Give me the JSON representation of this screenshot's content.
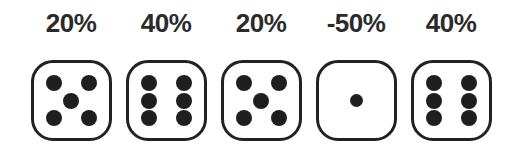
{
  "canvas": {
    "width": 522,
    "height": 154,
    "background_color": "#ffffff"
  },
  "style": {
    "die_outline_color": "#222222",
    "pip_color": "#1f1f1f",
    "label_color": "#2b2b2b"
  },
  "dice": [
    {
      "label": "20%",
      "face_value": 5,
      "pips": [
        {
          "col": "l",
          "row": "t",
          "size": "normal"
        },
        {
          "col": "r",
          "row": "t",
          "size": "normal"
        },
        {
          "col": "c",
          "row": "m",
          "size": "normal"
        },
        {
          "col": "l",
          "row": "b",
          "size": "normal"
        },
        {
          "col": "r",
          "row": "b",
          "size": "normal"
        }
      ]
    },
    {
      "label": "40%",
      "face_value": 6,
      "pips": [
        {
          "col": "l",
          "row": "t",
          "size": "normal"
        },
        {
          "col": "r",
          "row": "t",
          "size": "normal"
        },
        {
          "col": "l",
          "row": "m",
          "size": "normal"
        },
        {
          "col": "r",
          "row": "m",
          "size": "normal"
        },
        {
          "col": "l",
          "row": "b",
          "size": "normal"
        },
        {
          "col": "r",
          "row": "b",
          "size": "normal"
        }
      ]
    },
    {
      "label": "20%",
      "face_value": 5,
      "pips": [
        {
          "col": "l",
          "row": "t",
          "size": "normal"
        },
        {
          "col": "r",
          "row": "t",
          "size": "normal"
        },
        {
          "col": "c",
          "row": "m",
          "size": "normal"
        },
        {
          "col": "l",
          "row": "b",
          "size": "normal"
        },
        {
          "col": "r",
          "row": "b",
          "size": "normal"
        }
      ]
    },
    {
      "label": "-50%",
      "face_value": 1,
      "pips": [
        {
          "col": "c",
          "row": "m",
          "size": "small"
        }
      ]
    },
    {
      "label": "40%",
      "face_value": 6,
      "pips": [
        {
          "col": "l",
          "row": "t",
          "size": "normal"
        },
        {
          "col": "r",
          "row": "t",
          "size": "normal"
        },
        {
          "col": "l",
          "row": "m",
          "size": "normal"
        },
        {
          "col": "r",
          "row": "m",
          "size": "normal"
        },
        {
          "col": "l",
          "row": "b",
          "size": "normal"
        },
        {
          "col": "r",
          "row": "b",
          "size": "normal"
        }
      ]
    }
  ]
}
